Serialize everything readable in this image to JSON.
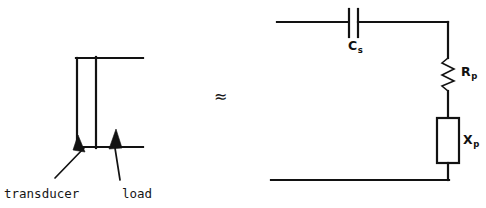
{
  "diagram": {
    "background_color": "#ffffff",
    "line_color": "#121212",
    "left_schematic": {
      "name": "transducer-load-schematic",
      "labels": [
        {
          "id": "transducer",
          "text": "transducer"
        },
        {
          "id": "load",
          "text": "load"
        }
      ],
      "elements": [
        {
          "id": "top-wire",
          "type": "wire"
        },
        {
          "id": "bottom-wire",
          "type": "wire"
        },
        {
          "id": "transducer-left-leg",
          "type": "wire"
        },
        {
          "id": "load-vertical-line",
          "type": "wire"
        }
      ]
    },
    "equivalence": {
      "symbol": "≈",
      "name": "approximately-equal-symbol"
    },
    "right_circuit": {
      "name": "equivalent-circuit",
      "components": [
        {
          "id": "capacitor",
          "symbol": "C",
          "subscript": "s",
          "type": "capacitor"
        },
        {
          "id": "resistor",
          "symbol": "R",
          "subscript": "p",
          "type": "resistor"
        },
        {
          "id": "reactance",
          "symbol": "X",
          "subscript": "p",
          "type": "impedance-box"
        }
      ],
      "elements": [
        {
          "id": "top-wire",
          "type": "wire"
        },
        {
          "id": "right-wire",
          "type": "wire"
        },
        {
          "id": "bottom-wire",
          "type": "wire"
        }
      ]
    }
  }
}
